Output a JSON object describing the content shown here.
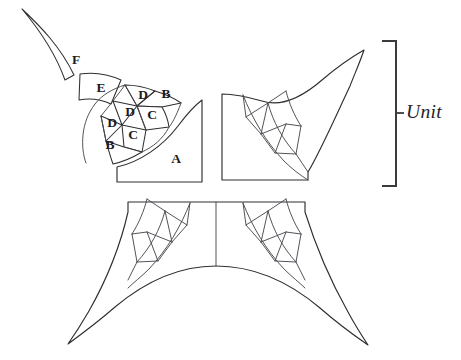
{
  "figure": {
    "background_color": "#ffffff",
    "line_color": "#2f2f33",
    "width": 461,
    "height": 360
  },
  "annotation": {
    "unit_label": "Unit",
    "bracket_side": "right"
  },
  "pieces": [
    {
      "id": "A",
      "label": "A",
      "label_x": 176,
      "label_y": 160
    },
    {
      "id": "B1",
      "label": "B",
      "label_x": 110,
      "label_y": 146
    },
    {
      "id": "C1",
      "label": "C",
      "label_x": 133,
      "label_y": 136
    },
    {
      "id": "D1",
      "label": "D",
      "label_x": 112,
      "label_y": 124
    },
    {
      "id": "D2",
      "label": "D",
      "label_x": 130,
      "label_y": 113
    },
    {
      "id": "C2",
      "label": "C",
      "label_x": 152,
      "label_y": 116
    },
    {
      "id": "D3",
      "label": "D",
      "label_x": 143,
      "label_y": 96
    },
    {
      "id": "B2",
      "label": "B",
      "label_x": 166,
      "label_y": 95
    },
    {
      "id": "E",
      "label": "E",
      "label_x": 101,
      "label_y": 89
    },
    {
      "id": "F",
      "label": "F",
      "label_x": 76,
      "label_y": 61
    }
  ],
  "assemblies": [
    {
      "id": "top-right-square",
      "label": ""
    },
    {
      "id": "bottom-left-square",
      "label": ""
    },
    {
      "id": "bottom-right-square",
      "label": ""
    }
  ]
}
